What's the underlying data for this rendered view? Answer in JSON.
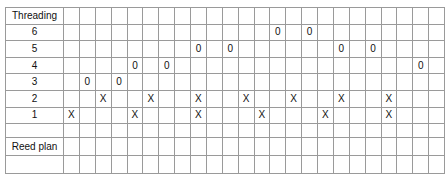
{
  "diagram": {
    "kind": "weaving-threading-draft",
    "columns": 24,
    "shafts": [
      6,
      5,
      4,
      3,
      2,
      1
    ]
  },
  "rows": {
    "threading_label": "Threading",
    "shaft_6_label": "6",
    "shaft_5_label": "5",
    "shaft_4_label": "4",
    "shaft_3_label": "3",
    "shaft_2_label": "2",
    "shaft_1_label": "1",
    "blank_label": "",
    "reed_plan_label": "Reed plan",
    "reed_blank_label": ""
  },
  "marks": {
    "x_symbol": "X",
    "o_symbol": "0",
    "empty": ""
  },
  "grid": {
    "threading_header": [
      "",
      "",
      "",
      "",
      "",
      "",
      "",
      "",
      "",
      "",
      "",
      "",
      "",
      "",
      "",
      "",
      "",
      "",
      "",
      "",
      "",
      "",
      "",
      ""
    ],
    "shaft_6": [
      "",
      "",
      "",
      "",
      "",
      "",
      "",
      "",
      "",
      "",
      "",
      "",
      "",
      "0",
      "",
      "0",
      "",
      "",
      "",
      "",
      "",
      "",
      "",
      ""
    ],
    "shaft_5": [
      "",
      "",
      "",
      "",
      "",
      "",
      "",
      "",
      "0",
      "",
      "0",
      "",
      "",
      "",
      "",
      "",
      "",
      "0",
      "",
      "0",
      "",
      "",
      "",
      ""
    ],
    "shaft_4": [
      "",
      "",
      "",
      "",
      "0",
      "",
      "0",
      "",
      "",
      "",
      "",
      "",
      "",
      "",
      "",
      "",
      "",
      "",
      "",
      "",
      "",
      "",
      "0",
      ""
    ],
    "shaft_3": [
      "",
      "0",
      "",
      "0",
      "",
      "",
      "",
      "",
      "",
      "",
      "",
      "",
      "",
      "",
      "",
      "",
      "",
      "",
      "",
      "",
      "",
      "",
      "",
      ""
    ],
    "shaft_2": [
      "",
      "",
      "X",
      "",
      "",
      "X",
      "",
      "",
      "X",
      "",
      "",
      "X",
      "",
      "",
      "X",
      "",
      "",
      "X",
      "",
      "",
      "X",
      "",
      "",
      ""
    ],
    "shaft_1": [
      "X",
      "",
      "",
      "",
      "X",
      "",
      "",
      "",
      "X",
      "",
      "",
      "",
      "X",
      "",
      "",
      "",
      "X",
      "",
      "",
      "",
      "X",
      "",
      "",
      ""
    ],
    "blank_row": [
      "",
      "",
      "",
      "",
      "",
      "",
      "",
      "",
      "",
      "",
      "",
      "",
      "",
      "",
      "",
      "",
      "",
      "",
      "",
      "",
      "",
      "",
      "",
      ""
    ],
    "reed_top": [
      1,
      1,
      1,
      1,
      0,
      0,
      0,
      0,
      1,
      1,
      1,
      1,
      0,
      0,
      0,
      0,
      1,
      1,
      1,
      1,
      0,
      0,
      0,
      0
    ],
    "reed_bottom": [
      0,
      0,
      0,
      0,
      1,
      1,
      1,
      1,
      0,
      0,
      0,
      0,
      1,
      1,
      1,
      1,
      0,
      0,
      0,
      0,
      1,
      1,
      1,
      1
    ]
  },
  "colors": {
    "grid_line": "#9a9a9a",
    "outer_border": "#555555",
    "fill": "#000000",
    "text": "#111111",
    "background": "#ffffff"
  }
}
